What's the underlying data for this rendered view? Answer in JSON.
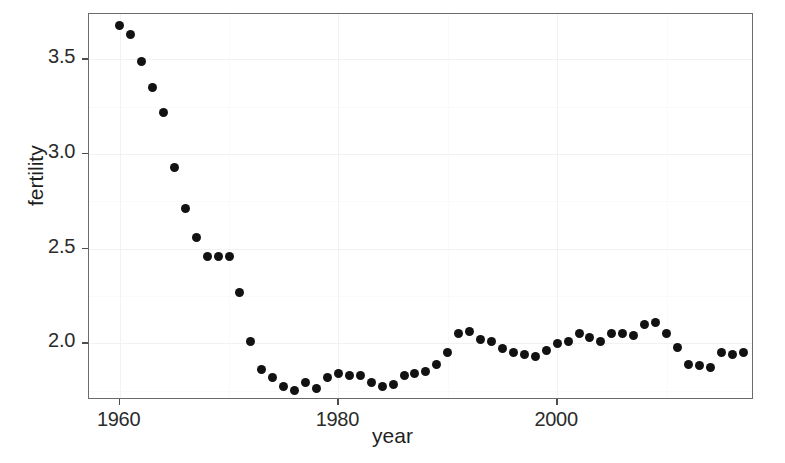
{
  "figure": {
    "background_color": "#ffffff",
    "panel": {
      "background_color": "#ffffff",
      "border_color": "#6b6b6b",
      "left_px": 88,
      "top_px": 13,
      "width_px": 665,
      "height_px": 386
    },
    "point_color": "#121212",
    "point_diameter_px": 9
  },
  "chart_data": {
    "type": "scatter",
    "title": "",
    "subtitle": "",
    "xlabel": "year",
    "ylabel": "fertility",
    "xlim": [
      1957.2,
      1919.0
    ],
    "x_axis_range": [
      1957.2,
      2018.0
    ],
    "ylim": [
      1.7,
      3.74
    ],
    "grid": true,
    "grid_color": "#f2f2f2",
    "legend": null,
    "legend_position": "none",
    "annotations": [],
    "x_ticks": [
      1960,
      1980,
      2000
    ],
    "x_tick_labels": [
      "1960",
      "1980",
      "2000"
    ],
    "y_ticks": [
      2.0,
      2.5,
      3.0,
      3.5
    ],
    "y_tick_labels": [
      "2.0",
      "2.5",
      "3.0",
      "3.5"
    ],
    "x_minor_ticks": [
      1970,
      1990,
      2010
    ],
    "y_minor_ticks": [
      1.75,
      2.25,
      2.75,
      3.25
    ],
    "series": [
      {
        "name": "fertility",
        "marker": "filled-circle",
        "color": "#121212",
        "points": [
          {
            "x": 1960,
            "y": 3.68
          },
          {
            "x": 1961,
            "y": 3.63
          },
          {
            "x": 1962,
            "y": 3.49
          },
          {
            "x": 1963,
            "y": 3.35
          },
          {
            "x": 1964,
            "y": 3.22
          },
          {
            "x": 1965,
            "y": 2.93
          },
          {
            "x": 1966,
            "y": 2.71
          },
          {
            "x": 1967,
            "y": 2.56
          },
          {
            "x": 1968,
            "y": 2.46
          },
          {
            "x": 1969,
            "y": 2.46
          },
          {
            "x": 1970,
            "y": 2.46
          },
          {
            "x": 1971,
            "y": 2.27
          },
          {
            "x": 1972,
            "y": 2.01
          },
          {
            "x": 1973,
            "y": 1.86
          },
          {
            "x": 1974,
            "y": 1.82
          },
          {
            "x": 1975,
            "y": 1.77
          },
          {
            "x": 1976,
            "y": 1.75
          },
          {
            "x": 1977,
            "y": 1.79
          },
          {
            "x": 1978,
            "y": 1.76
          },
          {
            "x": 1979,
            "y": 1.82
          },
          {
            "x": 1980,
            "y": 1.84
          },
          {
            "x": 1981,
            "y": 1.83
          },
          {
            "x": 1982,
            "y": 1.83
          },
          {
            "x": 1983,
            "y": 1.79
          },
          {
            "x": 1984,
            "y": 1.77
          },
          {
            "x": 1985,
            "y": 1.78
          },
          {
            "x": 1986,
            "y": 1.83
          },
          {
            "x": 1987,
            "y": 1.84
          },
          {
            "x": 1988,
            "y": 1.85
          },
          {
            "x": 1989,
            "y": 1.89
          },
          {
            "x": 1990,
            "y": 1.95
          },
          {
            "x": 1991,
            "y": 2.05
          },
          {
            "x": 1992,
            "y": 2.06
          },
          {
            "x": 1993,
            "y": 2.02
          },
          {
            "x": 1994,
            "y": 2.01
          },
          {
            "x": 1995,
            "y": 1.97
          },
          {
            "x": 1996,
            "y": 1.95
          },
          {
            "x": 1997,
            "y": 1.94
          },
          {
            "x": 1998,
            "y": 1.93
          },
          {
            "x": 1999,
            "y": 1.96
          },
          {
            "x": 2000,
            "y": 2.0
          },
          {
            "x": 2001,
            "y": 2.01
          },
          {
            "x": 2002,
            "y": 2.05
          },
          {
            "x": 2003,
            "y": 2.03
          },
          {
            "x": 2004,
            "y": 2.01
          },
          {
            "x": 2005,
            "y": 2.05
          },
          {
            "x": 2006,
            "y": 2.05
          },
          {
            "x": 2007,
            "y": 2.04
          },
          {
            "x": 2008,
            "y": 2.1
          },
          {
            "x": 2009,
            "y": 2.11
          },
          {
            "x": 2010,
            "y": 2.05
          },
          {
            "x": 2011,
            "y": 1.98
          },
          {
            "x": 2012,
            "y": 1.89
          },
          {
            "x": 2013,
            "y": 1.88
          },
          {
            "x": 2014,
            "y": 1.87
          },
          {
            "x": 2015,
            "y": 1.95
          },
          {
            "x": 2016,
            "y": 1.94
          },
          {
            "x": 2017,
            "y": 1.95
          }
        ]
      }
    ]
  }
}
